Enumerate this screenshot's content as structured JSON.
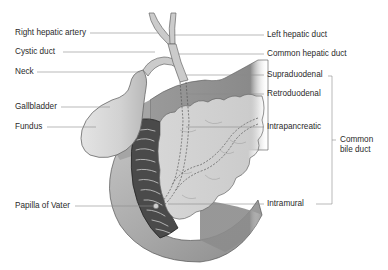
{
  "diagram": {
    "type": "anatomical-illustration",
    "labels_left": [
      {
        "id": "right-hepatic-artery",
        "text": "Right hepatic artery"
      },
      {
        "id": "cystic-duct",
        "text": "Cystic duct"
      },
      {
        "id": "neck",
        "text": "Neck"
      },
      {
        "id": "gallbladder",
        "text": "Gallbladder"
      },
      {
        "id": "fundus",
        "text": "Fundus"
      },
      {
        "id": "papilla-of-vater",
        "text": "Papilla of  Vater"
      }
    ],
    "labels_right": [
      {
        "id": "left-hepatic-duct",
        "text": "Left hepatic duct"
      },
      {
        "id": "common-hepatic-duct",
        "text": "Common hepatic duct"
      },
      {
        "id": "supraduodenal",
        "text": "Supraduodenal"
      },
      {
        "id": "retroduodenal",
        "text": "Retroduodenal"
      },
      {
        "id": "intrapancreatic",
        "text": "Intrapancreatic"
      },
      {
        "id": "intramural",
        "text": "Intramural"
      }
    ],
    "bracket_label": "Common bile duct",
    "bracket_groups": [
      "Supraduodenal",
      "Retroduodenal",
      "Intrapancreatic",
      "Intramural"
    ],
    "colors": {
      "background": "#ffffff",
      "leader_line": "#8a8a8a",
      "label_text": "#2a2a2a",
      "duct_fill": "#c9c9c9",
      "gallbladder_fill": "#d4d4d4",
      "duodenum_fill": "#9c9c9c",
      "duodenum_lumen": "#4a4a4a",
      "pancreas_fill": "#d0d0d0",
      "liver_fill": "#8e8e8e"
    }
  }
}
